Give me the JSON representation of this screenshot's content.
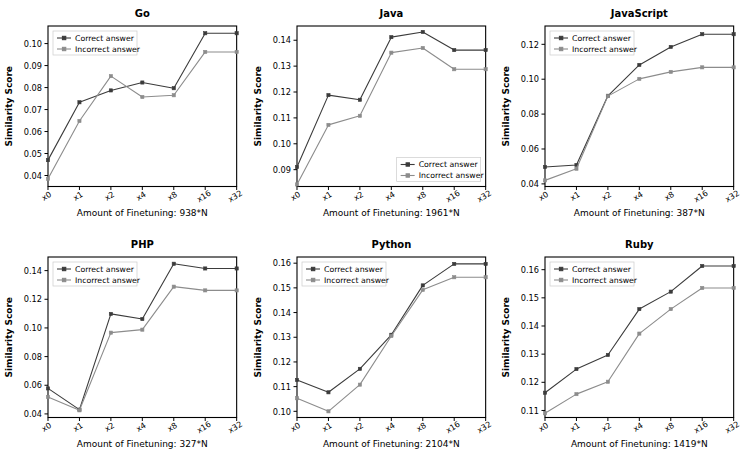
{
  "figure": {
    "background": "#ffffff",
    "layout": "2x3 grid of line charts",
    "shared_ylabel": "Similarity Score",
    "series_colors": {
      "correct": "#3b3b3b",
      "incorrect": "#8c8c8c"
    },
    "legend_labels": {
      "correct": "Correct answer",
      "incorrect": "Incorrect answer"
    }
  },
  "chart_data": [
    {
      "type": "line",
      "title": "Go",
      "xlabel": "Amount of Finetuning: 938*N",
      "ylabel": "Similarity Score",
      "categories": [
        "x0",
        "x1",
        "x2",
        "x4",
        "x8",
        "x16",
        "x32"
      ],
      "ylim": [
        0.035,
        0.108
      ],
      "yticks": [
        0.04,
        0.05,
        0.06,
        0.07,
        0.08,
        0.09,
        0.1
      ],
      "ytick_labels": [
        "0.04",
        "0.05",
        "0.06",
        "0.07",
        "0.08",
        "0.09",
        "0.10"
      ],
      "grid": false,
      "legend_position": "upper left",
      "series": [
        {
          "name": "Correct answer",
          "values": [
            0.047,
            0.0733,
            0.0787,
            0.0823,
            0.0797,
            0.1047,
            0.1047
          ]
        },
        {
          "name": "Incorrect answer",
          "values": [
            0.0385,
            0.0648,
            0.0852,
            0.0757,
            0.0765,
            0.0962,
            0.0962
          ]
        }
      ]
    },
    {
      "type": "line",
      "title": "Java",
      "xlabel": "Amount of Finetuning: 1961*N",
      "ylabel": "Similarity Score",
      "categories": [
        "x0",
        "x1",
        "x2",
        "x4",
        "x8",
        "x16",
        "x32"
      ],
      "ylim": [
        0.0835,
        0.1455
      ],
      "yticks": [
        0.09,
        0.1,
        0.11,
        0.12,
        0.13,
        0.14
      ],
      "ytick_labels": [
        "0.09",
        "0.10",
        "0.11",
        "0.12",
        "0.13",
        "0.14"
      ],
      "grid": false,
      "legend_position": "lower right",
      "series": [
        {
          "name": "Correct answer",
          "values": [
            0.091,
            0.1188,
            0.117,
            0.1412,
            0.1432,
            0.1362,
            0.1362
          ]
        },
        {
          "name": "Incorrect answer",
          "values": [
            0.0843,
            0.1073,
            0.1108,
            0.1352,
            0.137,
            0.1288,
            0.1288
          ]
        }
      ]
    },
    {
      "type": "line",
      "title": "JavaScript",
      "xlabel": "Amount of Finetuning: 387*N",
      "ylabel": "Similarity Score",
      "categories": [
        "x0",
        "x1",
        "x2",
        "x4",
        "x8",
        "x16",
        "x32"
      ],
      "ylim": [
        0.0385,
        0.1305
      ],
      "yticks": [
        0.04,
        0.06,
        0.08,
        0.1,
        0.12
      ],
      "ytick_labels": [
        "0.04",
        "0.06",
        "0.08",
        "0.10",
        "0.12"
      ],
      "grid": false,
      "legend_position": "upper left",
      "series": [
        {
          "name": "Correct answer",
          "values": [
            0.0497,
            0.0508,
            0.0905,
            0.1082,
            0.1185,
            0.1258,
            0.1258
          ]
        },
        {
          "name": "Incorrect answer",
          "values": [
            0.042,
            0.0487,
            0.0903,
            0.1002,
            0.1042,
            0.1068,
            0.1068
          ]
        }
      ]
    },
    {
      "type": "line",
      "title": "PHP",
      "xlabel": "Amount of Finetuning: 327*N",
      "ylabel": "Similarity Score",
      "categories": [
        "x0",
        "x1",
        "x2",
        "x4",
        "x8",
        "x16",
        "x32"
      ],
      "ylim": [
        0.0375,
        0.1495
      ],
      "yticks": [
        0.04,
        0.06,
        0.08,
        0.1,
        0.12,
        0.14
      ],
      "ytick_labels": [
        "0.04",
        "0.06",
        "0.08",
        "0.10",
        "0.12",
        "0.14"
      ],
      "grid": false,
      "legend_position": "upper left",
      "series": [
        {
          "name": "Correct answer",
          "values": [
            0.0578,
            0.043,
            0.1098,
            0.1062,
            0.1448,
            0.1415,
            0.1415
          ]
        },
        {
          "name": "Incorrect answer",
          "values": [
            0.0518,
            0.0425,
            0.0967,
            0.0988,
            0.1288,
            0.1262,
            0.1262
          ]
        }
      ]
    },
    {
      "type": "line",
      "title": "Python",
      "xlabel": "Amount of Finetuning: 2104*N",
      "ylabel": "Similarity Score",
      "categories": [
        "x0",
        "x1",
        "x2",
        "x4",
        "x8",
        "x16",
        "x32"
      ],
      "ylim": [
        0.0975,
        0.1625
      ],
      "yticks": [
        0.1,
        0.11,
        0.12,
        0.13,
        0.14,
        0.15,
        0.16
      ],
      "ytick_labels": [
        "0.10",
        "0.11",
        "0.12",
        "0.13",
        "0.14",
        "0.15",
        "0.16"
      ],
      "grid": false,
      "legend_position": "upper left",
      "series": [
        {
          "name": "Correct answer",
          "values": [
            0.1127,
            0.1077,
            0.1172,
            0.131,
            0.151,
            0.1597,
            0.1597
          ]
        },
        {
          "name": "Incorrect answer",
          "values": [
            0.1053,
            0.1,
            0.1108,
            0.1305,
            0.1492,
            0.1543,
            0.1543
          ]
        }
      ]
    },
    {
      "type": "line",
      "title": "Ruby",
      "xlabel": "Amount of Finetuning: 1419*N",
      "ylabel": "Similarity Score",
      "categories": [
        "x0",
        "x1",
        "x2",
        "x4",
        "x8",
        "x16",
        "x32"
      ],
      "ylim": [
        0.1075,
        0.1645
      ],
      "yticks": [
        0.11,
        0.12,
        0.13,
        0.14,
        0.15,
        0.16
      ],
      "ytick_labels": [
        "0.11",
        "0.12",
        "0.13",
        "0.14",
        "0.15",
        "0.16"
      ],
      "grid": false,
      "legend_position": "upper left",
      "series": [
        {
          "name": "Correct answer",
          "values": [
            0.1163,
            0.1247,
            0.1297,
            0.146,
            0.1522,
            0.1613,
            0.1613
          ]
        },
        {
          "name": "Incorrect answer",
          "values": [
            0.109,
            0.1158,
            0.1202,
            0.1373,
            0.146,
            0.1535,
            0.1535
          ]
        }
      ]
    }
  ]
}
